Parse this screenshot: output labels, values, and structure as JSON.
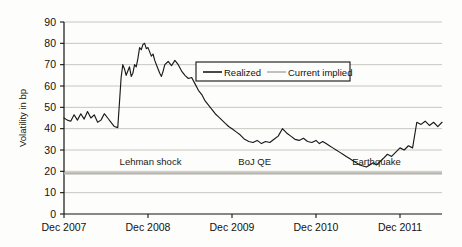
{
  "chart_data": {
    "type": "line",
    "title": "",
    "xlabel": "",
    "ylabel": "Volatility in bp",
    "ylim": [
      0,
      90
    ],
    "ytick_values": [
      0,
      10,
      20,
      30,
      40,
      50,
      60,
      70,
      80,
      90
    ],
    "ytick_labels": [
      "0",
      "10",
      "20",
      "30",
      "40",
      "50",
      "60",
      "70",
      "80",
      "90"
    ],
    "xtick_labels": [
      "Dec 2007",
      "Dec 2008",
      "Dec 2009",
      "Dec 2010",
      "Dec 2011"
    ],
    "xlim": [
      "Dec 2007",
      "Jun 2012"
    ],
    "grid": "horizontal",
    "legend_position": "upper-center",
    "series": [
      {
        "name": "Realized",
        "color": "#1a1a1a",
        "style": "solid",
        "x": [
          0.0,
          0.04,
          0.08,
          0.12,
          0.16,
          0.2,
          0.24,
          0.28,
          0.32,
          0.36,
          0.4,
          0.44,
          0.48,
          0.52,
          0.56,
          0.6,
          0.64,
          0.66,
          0.68,
          0.7,
          0.72,
          0.74,
          0.76,
          0.78,
          0.8,
          0.82,
          0.84,
          0.86,
          0.88,
          0.9,
          0.92,
          0.94,
          0.96,
          0.98,
          1.0,
          1.02,
          1.04,
          1.06,
          1.08,
          1.1,
          1.12,
          1.14,
          1.16,
          1.18,
          1.2,
          1.24,
          1.28,
          1.32,
          1.36,
          1.4,
          1.44,
          1.48,
          1.52,
          1.56,
          1.6,
          1.64,
          1.68,
          1.72,
          1.76,
          1.8,
          1.84,
          1.88,
          1.92,
          1.96,
          2.0,
          2.05,
          2.1,
          2.15,
          2.2,
          2.25,
          2.3,
          2.35,
          2.4,
          2.45,
          2.5,
          2.55,
          2.6,
          2.65,
          2.7,
          2.75,
          2.8,
          2.85,
          2.9,
          2.95,
          3.0,
          3.04,
          3.08,
          3.12,
          3.16,
          3.2,
          3.24,
          3.28,
          3.32,
          3.36,
          3.4,
          3.44,
          3.48,
          3.52,
          3.56,
          3.6,
          3.64,
          3.68,
          3.72,
          3.76,
          3.8,
          3.85,
          3.9,
          3.95,
          4.0,
          4.05,
          4.1,
          4.15,
          4.2,
          4.25,
          4.3,
          4.35,
          4.4,
          4.45,
          4.5
        ],
        "y": [
          45.0,
          44.0,
          43.5,
          46.5,
          44.0,
          47.0,
          44.5,
          48.0,
          45.0,
          46.5,
          43.0,
          44.0,
          47.0,
          45.0,
          43.0,
          41.0,
          40.5,
          52.0,
          64.0,
          70.0,
          68.0,
          65.0,
          67.0,
          69.0,
          64.5,
          66.0,
          70.0,
          69.0,
          73.0,
          78.0,
          77.0,
          79.5,
          80.0,
          77.5,
          78.0,
          76.0,
          74.0,
          75.0,
          72.0,
          70.0,
          68.0,
          66.0,
          64.5,
          67.0,
          70.0,
          71.5,
          69.5,
          72.0,
          70.0,
          67.0,
          65.0,
          63.5,
          64.0,
          61.0,
          58.0,
          56.0,
          53.0,
          51.0,
          49.0,
          47.0,
          45.5,
          44.0,
          42.5,
          41.0,
          40.0,
          38.5,
          37.0,
          35.0,
          34.0,
          33.5,
          34.5,
          33.0,
          34.0,
          33.5,
          35.0,
          36.5,
          40.0,
          38.0,
          36.5,
          35.0,
          34.5,
          35.5,
          34.0,
          33.5,
          34.5,
          33.0,
          34.0,
          33.0,
          32.0,
          31.0,
          30.0,
          29.0,
          28.0,
          27.0,
          26.0,
          25.0,
          24.0,
          23.0,
          22.5,
          22.0,
          23.0,
          24.0,
          23.0,
          24.5,
          26.0,
          28.0,
          27.0,
          29.0,
          31.0,
          30.0,
          32.0,
          31.0,
          43.0,
          42.0,
          43.5,
          41.5,
          43.0,
          41.0,
          43.0
        ],
        "note": "Realized volatility: ~45bp pre-crisis, spike at Lehman to ~80bp peak, long decline to ~33bp, trough ~22bp mid-2010, step up to ~43bp at earthquake, then decline to ~18bp"
      },
      {
        "name": "Current implied",
        "color": "#b4b2ad",
        "style": "solid",
        "constant_value": 19,
        "note": "Flat horizontal reference line at ~19 bp spanning the full x range"
      }
    ],
    "annotations": [
      {
        "text": "Lehman shock",
        "x_label": "Dec 2007-Jun 2008",
        "y": 23
      },
      {
        "text": "BoJ QE",
        "x_label": "Dec 2009",
        "y": 23
      },
      {
        "text": "Earthquake",
        "x_label": "Mar 2011",
        "y": 23
      }
    ]
  },
  "legend": {
    "entries": [
      {
        "label": "Realized"
      },
      {
        "label": "Current implied"
      }
    ]
  },
  "axes": {
    "y_title": "Volatility in bp",
    "y_ticks": [
      "90",
      "80",
      "70",
      "60",
      "50",
      "40",
      "30",
      "20",
      "10",
      "0"
    ],
    "x_ticks": [
      "Dec 2007",
      "Dec 2008",
      "Dec 2009",
      "Dec 2010",
      "Dec 2011"
    ]
  },
  "annotations": {
    "lehman": "Lehman shock",
    "boj": "BoJ QE",
    "earthquake": "Earthquake"
  },
  "colors": {
    "realized_line": "#1a1a1a",
    "implied_line": "#b4b2ad",
    "gridline": "#b9b7b2",
    "axis": "#17130f",
    "background": "#fdfdfb"
  }
}
